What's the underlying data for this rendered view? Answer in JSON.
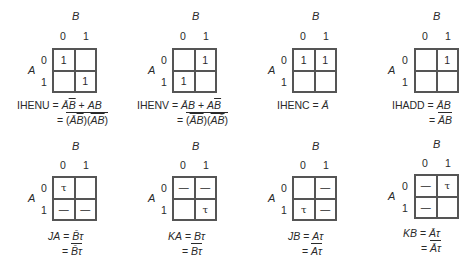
{
  "maps": [
    {
      "id": "ihenu",
      "col_var": "B",
      "row_var": "A",
      "col_labels": [
        "0",
        "1"
      ],
      "row_labels": [
        "0",
        "1"
      ],
      "cells": [
        [
          "1",
          ""
        ],
        [
          "",
          "1"
        ]
      ],
      "eq_line1": "IHENU = ĀB̄ + AB",
      "eq_line2": "= (ĀB̄‾)(AB‾)‾",
      "lhs": "IHENU",
      "rhs1": "ĀB̄ + AB",
      "rhs2": "(ĀB̄)(AB)"
    },
    {
      "id": "ihenv",
      "col_var": "B",
      "row_var": "A",
      "col_labels": [
        "0",
        "1"
      ],
      "row_labels": [
        "0",
        "1"
      ],
      "cells": [
        [
          "",
          "1"
        ],
        [
          "1",
          ""
        ]
      ],
      "lhs": "IHENV",
      "rhs1": "ĀB + AB̄",
      "rhs2": "(ĀB)(AB̄)"
    },
    {
      "id": "ihenc",
      "col_var": "B",
      "row_var": "A",
      "col_labels": [
        "0",
        "1"
      ],
      "row_labels": [
        "0",
        "1"
      ],
      "cells": [
        [
          "1",
          "1"
        ],
        [
          "",
          ""
        ]
      ],
      "lhs": "IHENC",
      "rhs1": "Ā",
      "rhs2": ""
    },
    {
      "id": "ihadd",
      "col_var": "B",
      "row_var": "A",
      "col_labels": [
        "0",
        "1"
      ],
      "row_labels": [
        "0",
        "1"
      ],
      "cells": [
        [
          "",
          "1"
        ],
        [
          "",
          ""
        ]
      ],
      "lhs": "IHADD",
      "rhs1": "ĀB",
      "rhs2": "ĀB"
    },
    {
      "id": "ja",
      "col_var": "B",
      "row_var": "A",
      "col_labels": [
        "0",
        "1"
      ],
      "row_labels": [
        "0",
        "1"
      ],
      "cells": [
        [
          "τ",
          ""
        ],
        [
          "—",
          "—"
        ]
      ],
      "lhs": "JA",
      "rhs1": "B̄τ",
      "rhs2": "B̄τ"
    },
    {
      "id": "ka",
      "col_var": "B",
      "row_var": "A",
      "col_labels": [
        "0",
        "1"
      ],
      "row_labels": [
        "0",
        "1"
      ],
      "cells": [
        [
          "—",
          "—"
        ],
        [
          "",
          "τ"
        ]
      ],
      "lhs": "KA",
      "rhs1": "Bτ",
      "rhs2": "Bτ"
    },
    {
      "id": "jb",
      "col_var": "B",
      "row_var": "A",
      "col_labels": [
        "0",
        "1"
      ],
      "row_labels": [
        "0",
        "1"
      ],
      "cells": [
        [
          "",
          "—"
        ],
        [
          "τ",
          "—"
        ]
      ],
      "lhs": "JB",
      "rhs1": "Aτ",
      "rhs2": "Aτ"
    },
    {
      "id": "kb",
      "col_var": "B",
      "row_var": "A",
      "col_labels": [
        "0",
        "1"
      ],
      "row_labels": [
        "0",
        "1"
      ],
      "cells": [
        [
          "—",
          "τ"
        ],
        [
          "—",
          ""
        ]
      ],
      "lhs": "KB",
      "rhs1": "Āτ",
      "rhs2": "Āτ"
    }
  ],
  "symbols": {
    "equals": "=",
    "plus": "+"
  }
}
